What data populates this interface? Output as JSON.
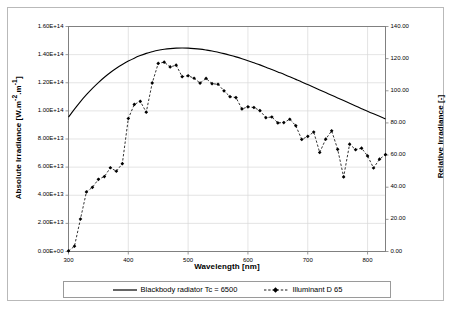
{
  "chart_data": {
    "type": "line",
    "title": "",
    "xlabel": "Wavelength [nm]",
    "ylabel": "Absolute Irradiance [W.m-2.m-1]",
    "ylabel_right": "Relative Irradiance [-]",
    "xlim": [
      300,
      830
    ],
    "ylim": [
      0,
      160000000000000.0
    ],
    "ylim_right": [
      0,
      140
    ],
    "grid": true,
    "legend_position": "bottom",
    "x_ticks": [
      300,
      400,
      500,
      600,
      700,
      800
    ],
    "x_tick_labels": [
      "300",
      "400",
      "500",
      "600",
      "700",
      "800"
    ],
    "y_ticks_left": [
      0,
      20000000000000.0,
      40000000000000.0,
      60000000000000.0,
      80000000000000.0,
      100000000000000.0,
      120000000000000.0,
      140000000000000.0,
      160000000000000.0
    ],
    "y_tick_labels_left": [
      "0.00E+00",
      "2.00E+13",
      "4.00E+13",
      "6.00E+13",
      "8.00E+13",
      "1.00E+14",
      "1.20E+14",
      "1.40E+14",
      "1.60E+14"
    ],
    "y_ticks_right": [
      0,
      20,
      40,
      60,
      80,
      100,
      120,
      140
    ],
    "y_tick_labels_right": [
      "0.00",
      "20.00",
      "40.00",
      "60.00",
      "80.00",
      "100.00",
      "120.00",
      "140.00"
    ],
    "series": [
      {
        "name": "Blackbody radiator Tc = 6500",
        "style": "solid",
        "marker": "none",
        "color": "#000000",
        "axis": "left",
        "x": [
          300,
          310,
          320,
          330,
          340,
          350,
          360,
          370,
          380,
          390,
          400,
          410,
          420,
          430,
          440,
          450,
          460,
          470,
          480,
          490,
          500,
          510,
          520,
          530,
          540,
          550,
          560,
          570,
          580,
          590,
          600,
          610,
          620,
          630,
          640,
          650,
          660,
          670,
          680,
          690,
          700,
          710,
          720,
          730,
          740,
          750,
          760,
          770,
          780,
          790,
          800,
          810,
          820,
          830
        ],
        "y": [
          95500000000000.0,
          101200000000000.0,
          106600000000000.0,
          111500000000000.0,
          116000000000000.0,
          120100000000000.0,
          123900000000000.0,
          127300000000000.0,
          130300000000000.0,
          133000000000000.0,
          135400000000000.0,
          137500000000000.0,
          139300000000000.0,
          140900000000000.0,
          142100000000000.0,
          143100000000000.0,
          143800000000000.0,
          144300000000000.0,
          144600000000000.0,
          144700000000000.0,
          144600000000000.0,
          144300000000000.0,
          143900000000000.0,
          143300000000000.0,
          142600000000000.0,
          141700000000000.0,
          140700000000000.0,
          139600000000000.0,
          138400000000000.0,
          137100000000000.0,
          135700000000000.0,
          134200000000000.0,
          132700000000000.0,
          131100000000000.0,
          129400000000000.0,
          127700000000000.0,
          126000000000000.0,
          124200000000000.0,
          122400000000000.0,
          120600000000000.0,
          118700000000000.0,
          116800000000000.0,
          114900000000000.0,
          113000000000000.0,
          111100000000000.0,
          109200000000000.0,
          107300000000000.0,
          105400000000000.0,
          103500000000000.0,
          101600000000000.0,
          99700000000000.0,
          97900000000000.0,
          96100000000000.0,
          94300000000000.0
        ]
      },
      {
        "name": "Illuminant D 65",
        "style": "dashed",
        "marker": "diamond",
        "color": "#000000",
        "axis": "right",
        "x": [
          300,
          310,
          320,
          330,
          340,
          350,
          360,
          370,
          380,
          390,
          400,
          410,
          420,
          430,
          440,
          450,
          460,
          470,
          480,
          490,
          500,
          510,
          520,
          530,
          540,
          550,
          560,
          570,
          580,
          590,
          600,
          610,
          620,
          630,
          640,
          650,
          660,
          670,
          680,
          690,
          700,
          710,
          720,
          730,
          740,
          750,
          760,
          770,
          780,
          790,
          800,
          810,
          820,
          830
        ],
        "y": [
          0.34,
          3.29,
          20.24,
          37.05,
          39.95,
          44.91,
          46.64,
          52.09,
          49.98,
          54.65,
          82.75,
          91.49,
          93.43,
          86.68,
          104.87,
          117.01,
          117.81,
          114.86,
          115.92,
          108.81,
          109.35,
          107.8,
          104.79,
          107.69,
          104.41,
          104.05,
          100.0,
          96.33,
          95.79,
          88.69,
          90.01,
          89.6,
          87.7,
          83.29,
          83.7,
          80.03,
          80.21,
          82.28,
          78.28,
          69.72,
          71.61,
          74.35,
          61.6,
          69.89,
          75.09,
          63.59,
          46.42,
          66.81,
          63.38,
          64.3,
          59.45,
          51.96,
          57.44,
          60.31
        ]
      }
    ]
  },
  "axes": {
    "x_title": "Wavelength [nm]",
    "y_left_title_main": "Absolute Irradiance [W.m",
    "y_left_title_sup1": "-2",
    "y_left_title_mid": ".m",
    "y_left_title_sup2": "-1",
    "y_left_title_end": "]",
    "y_right_title": "Relative Irradiance [-]"
  },
  "legend": {
    "items": [
      {
        "label": "Blackbody radiator Tc = 6500",
        "style": "solid"
      },
      {
        "label": "Illuminant D 65",
        "style": "dashed-marker"
      }
    ]
  },
  "colors": {
    "line": "#000000",
    "grid": "#d9d9d9",
    "axis": "#808080",
    "frame": "#b9b9b9"
  }
}
